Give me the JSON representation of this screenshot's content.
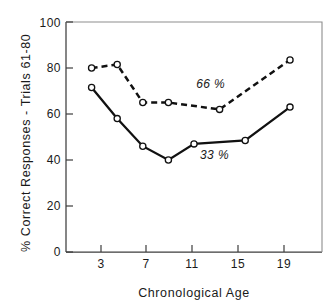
{
  "chart_data": {
    "type": "line",
    "title": "",
    "subtitle": "",
    "xlabel": "Chronological Age",
    "ylabel": "% Correct Responses - Trials 61-80",
    "xlim": [
      1,
      21
    ],
    "ylim": [
      0,
      100
    ],
    "grid": false,
    "legend_position": "inline-annotation",
    "x_ticks": [
      "3",
      "7",
      "11",
      "15",
      "19"
    ],
    "x_tick_values": [
      3,
      7,
      11,
      15,
      19
    ],
    "y_ticks": [
      "0",
      "20",
      "40",
      "60",
      "80",
      "100"
    ],
    "y_tick_values": [
      0,
      20,
      40,
      60,
      80,
      100
    ],
    "series": [
      {
        "name": "66 %",
        "style": "dashed",
        "marker": "open-circle",
        "color": "#111111",
        "annotation": "66 %",
        "annotation_x": 12.3,
        "annotation_y": 71.5,
        "x": [
          3,
          5,
          7,
          9,
          13,
          18.5
        ],
        "values": [
          80,
          81.5,
          65,
          65,
          62,
          83.5
        ]
      },
      {
        "name": "33 %",
        "style": "solid",
        "marker": "open-circle",
        "color": "#111111",
        "annotation": "33 %",
        "annotation_x": 12.6,
        "annotation_y": 40.5,
        "x": [
          3,
          5,
          7,
          9,
          11,
          15,
          18.5
        ],
        "values": [
          71.5,
          58,
          46,
          40,
          47,
          48.5,
          63
        ]
      }
    ]
  },
  "figure": {
    "xlabel": "Chronological Age",
    "ylabel": "% Correct Responses - Trials 61-80"
  }
}
